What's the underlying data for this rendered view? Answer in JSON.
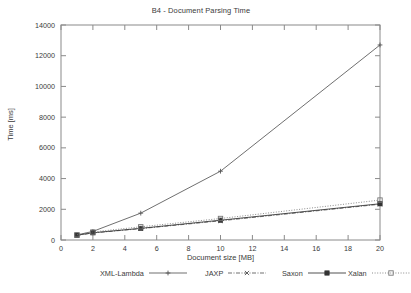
{
  "chart_data": {
    "type": "line",
    "title": "B4 - Document Parsing Time",
    "xlabel": "Document size [MB]",
    "ylabel": "Time [ms]",
    "xlim": [
      0,
      20
    ],
    "ylim": [
      0,
      14000
    ],
    "xticks": [
      0,
      2,
      4,
      6,
      8,
      10,
      12,
      14,
      16,
      18,
      20
    ],
    "yticks": [
      0,
      2000,
      4000,
      6000,
      8000,
      10000,
      12000,
      14000
    ],
    "grid": false,
    "legend_position": "below",
    "x": [
      1,
      2,
      5,
      10,
      20
    ],
    "series": [
      {
        "name": "XML-Lambda",
        "values": [
          330,
          560,
          1750,
          4480,
          12700
        ],
        "line_style": "solid",
        "marker": "plus",
        "color": "#555555"
      },
      {
        "name": "JAXP",
        "values": [
          300,
          460,
          740,
          1250,
          2330
        ],
        "line_style": "dash-dot",
        "marker": "cross",
        "color": "#555555"
      },
      {
        "name": "Saxon",
        "values": [
          310,
          470,
          760,
          1290,
          2360
        ],
        "line_style": "solid",
        "marker": "filled-square",
        "color": "#333333"
      },
      {
        "name": "Xalan",
        "values": [
          340,
          520,
          860,
          1400,
          2600
        ],
        "line_style": "dotted",
        "marker": "open-square",
        "color": "#777777"
      }
    ]
  },
  "legend": {
    "entries": [
      {
        "label": "XML-Lambda",
        "marker_glyph": "plus-marker-icon"
      },
      {
        "label": "JAXP",
        "marker_glyph": "cross-marker-icon"
      },
      {
        "label": "Saxon",
        "marker_glyph": "filled-square-marker-icon"
      },
      {
        "label": "Xalan",
        "marker_glyph": "open-square-marker-icon"
      }
    ]
  },
  "axes": {
    "ytick_labels": [
      "0",
      "2000",
      "4000",
      "6000",
      "8000",
      "10000",
      "12000",
      "14000"
    ],
    "xtick_labels": [
      "0",
      "2",
      "4",
      "6",
      "8",
      "10",
      "12",
      "14",
      "16",
      "18",
      "20"
    ]
  }
}
